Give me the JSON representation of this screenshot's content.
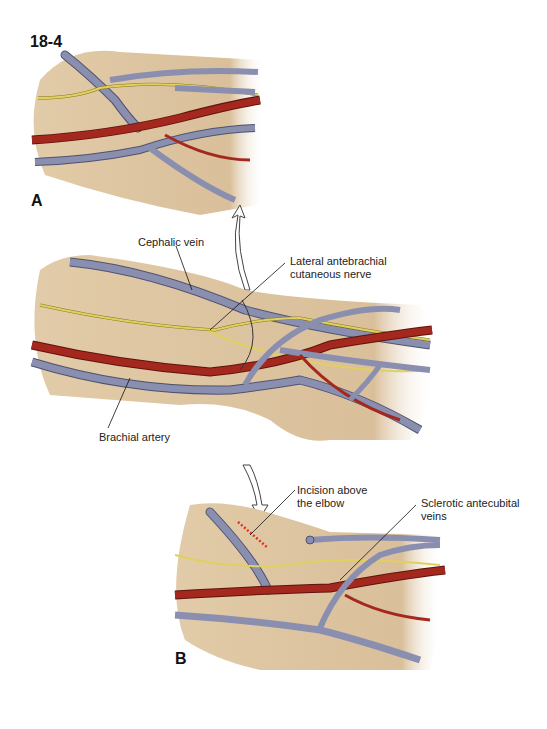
{
  "figure": {
    "number": "18-4",
    "panels": [
      {
        "id": "A",
        "label": "A"
      },
      {
        "id": "main",
        "label": ""
      },
      {
        "id": "B",
        "label": "B"
      }
    ]
  },
  "labels": {
    "cephalic_vein": "Cephalic vein",
    "lateral_nerve_line1": "Lateral antebrachial",
    "lateral_nerve_line2": "cutaneous nerve",
    "brachial_artery": "Brachial artery",
    "incision_line1": "Incision above",
    "incision_line2": "the elbow",
    "sclerotic_line1": "Sclerotic antecubital",
    "sclerotic_line2": "veins"
  },
  "colors": {
    "skin": "#dcc3a0",
    "skin_shadow": "#c9ac85",
    "vein": "#8a8fb0",
    "vein_outline": "#4e5270",
    "artery": "#a5281e",
    "artery_outline": "#5e140e",
    "nerve": "#e0d060",
    "nerve_outline": "#8a7a20",
    "incision": "#e0301e"
  }
}
